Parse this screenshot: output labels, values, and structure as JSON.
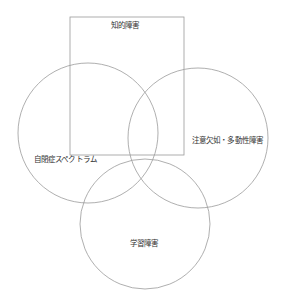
{
  "diagram": {
    "type": "venn",
    "background": "#ffffff",
    "stroke_color": "#9a9a9a",
    "text_color": "#333333",
    "shapes": {
      "rectangle": {
        "label": "知的障害",
        "x": 70,
        "y": 17,
        "width": 114,
        "height": 138
      },
      "circle_left": {
        "label": "自閉症スペクトラム",
        "cx": 88,
        "cy": 133,
        "r": 70
      },
      "circle_right": {
        "label": "注意欠如・多動性障害",
        "cx": 198,
        "cy": 138,
        "r": 70
      },
      "circle_bottom": {
        "label": "学習障害",
        "cx": 145,
        "cy": 224,
        "r": 65
      }
    }
  }
}
